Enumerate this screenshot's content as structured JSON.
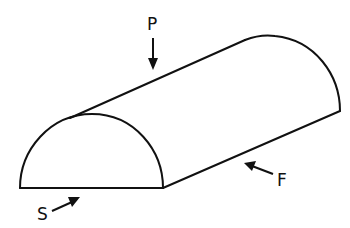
{
  "diagram": {
    "stroke_color": "#111111",
    "background": "#ffffff",
    "labels": {
      "top": "P",
      "side": "F",
      "front": "S"
    },
    "arrows": [
      {
        "label": "P",
        "direction": "down",
        "meaning": "plan view"
      },
      {
        "label": "F",
        "direction": "up-left",
        "meaning": "front view"
      },
      {
        "label": "S",
        "direction": "up-right",
        "meaning": "side view"
      }
    ]
  }
}
